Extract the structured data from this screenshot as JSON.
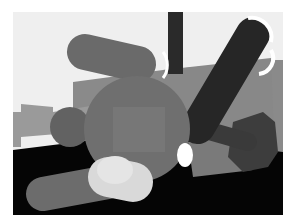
{
  "scene": {
    "description": "Grayscale 3D render of a capsule-limbed robot with a central sphere torso",
    "colors": {
      "background_wall": "#efefef",
      "floor_dark": "#050505",
      "floor_plane": "#6e6e6e",
      "wall_mid": "#8a8a8a",
      "left_block": "#9a9a9a",
      "pillar": "#2a2a2a",
      "torso_sphere": "#6f6f6f",
      "torso_face": "#7a7a7a",
      "upper_capsule": "#6a6a6a",
      "dark_capsule": "#262626",
      "left_ball": "#626262",
      "bottom_capsule": "#6c6c6c",
      "white_capsule": "#d9d9d9",
      "right_shadow_body": "#3d3d3d",
      "box": "#7a7a7a",
      "highlight": "#ffffff"
    }
  }
}
